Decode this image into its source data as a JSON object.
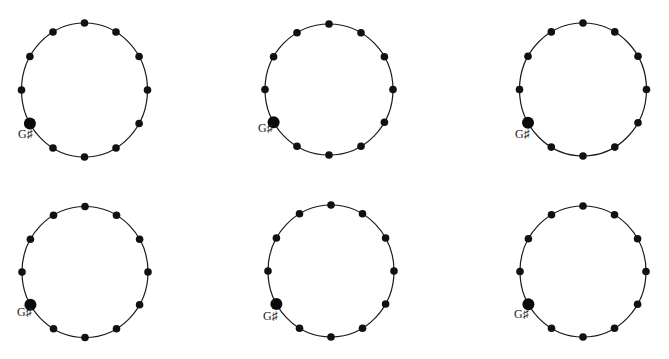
{
  "diagram": {
    "type": "pitch-class-circles",
    "layout": {
      "rows": 2,
      "cols": 3
    },
    "positions_per_circle": 12,
    "highlight_position_angle_deg": 150,
    "colors": {
      "line": "#1a1a1a",
      "dot": "#111111",
      "background": "#ffffff"
    },
    "circles": [
      {
        "cx": 84.5,
        "cy": 90,
        "rx": 63,
        "ry": 67,
        "label": "G♯",
        "label_x": 18,
        "label_y": 138
      },
      {
        "cx": 329,
        "cy": 89.5,
        "rx": 64,
        "ry": 65.5,
        "label": "G♯",
        "label_x": 258,
        "label_y": 132
      },
      {
        "cx": 583,
        "cy": 89.5,
        "rx": 63.5,
        "ry": 66.5,
        "label": "G♯",
        "label_x": 515,
        "label_y": 138
      },
      {
        "cx": 85,
        "cy": 272,
        "rx": 63,
        "ry": 65.5,
        "label": "G♯",
        "label_x": 17,
        "label_y": 316
      },
      {
        "cx": 331,
        "cy": 271,
        "rx": 63,
        "ry": 66,
        "label": "G♯",
        "label_x": 263,
        "label_y": 320
      },
      {
        "cx": 583,
        "cy": 271.5,
        "rx": 63,
        "ry": 65.5,
        "label": "G♯",
        "label_x": 514,
        "label_y": 318
      }
    ]
  }
}
